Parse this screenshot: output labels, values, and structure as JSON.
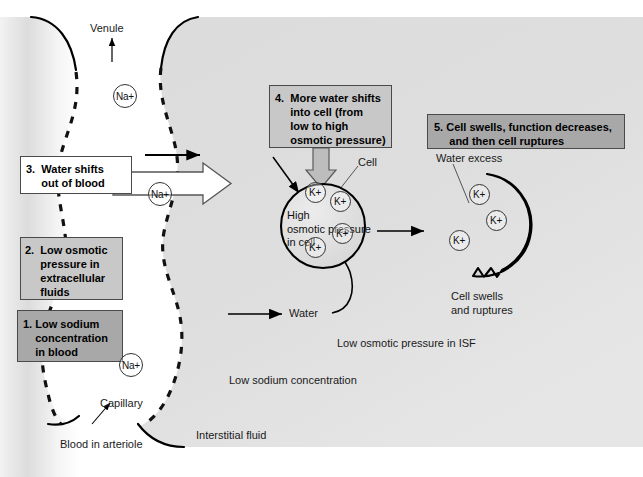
{
  "figure": {
    "colors": {
      "interstitial_fluid": "#d9d9d9",
      "blood_vessel": "#e8e8e8",
      "box_light_gray": "#c8c8c8",
      "box_dark_gray": "#a8a8a8",
      "box_white": "#ffffff",
      "outline": "#000000",
      "arrow_white_fill": "#ffffff",
      "arrow_gray_fill": "#bdbdbd",
      "text": "#1a1a1a"
    }
  },
  "steps": [
    {
      "number": "1.",
      "text": "Low sodium\nconcentration\nin blood",
      "style": "box-gray-dark"
    },
    {
      "number": "2.",
      "text": "Low osmotic\npressure in\nextracellular\nfluids",
      "style": "box-gray-light"
    },
    {
      "number": "3.",
      "text": "Water shifts\nout of blood",
      "style": "box-white"
    },
    {
      "number": "4.",
      "text": "More water shifts\ninto cell (from\nlow to high\nosmotic pressure)",
      "style": "box-gray-light"
    },
    {
      "number": "5.",
      "text": "Cell swells, function decreases,\nand then cell ruptures",
      "style": "box-gray-dark"
    }
  ],
  "box_text": {
    "step1": "1. Low sodium\n    concentration\n    in blood",
    "step2": "2.  Low osmotic\n     pressure in\n     extracellular\n     fluids",
    "step3": "3.  Water shifts\n     out of blood",
    "step4": "4.  More water shifts\n     into cell (from\n     low to high\n     osmotic pressure)",
    "step5": "5. Cell swells, function decreases,\n     and then cell ruptures"
  },
  "labels": {
    "venule": "Venule",
    "capillary": "Capillary",
    "blood_in_arteriole": "Blood in arteriole",
    "interstitial_fluid": "Interstitial fluid",
    "low_sodium_concentration": "Low sodium concentration",
    "low_osmotic_pressure_isf": "Low osmotic pressure in ISF",
    "cell": "Cell",
    "water": "Water",
    "water_excess": "Water excess",
    "cell_swells_and_ruptures": "Cell swells\nand ruptures",
    "high_osmotic_pressure_in_cell": "High\nosmotic pressure\nin cell"
  },
  "ions": {
    "sodium_label": "Na+",
    "potassium_label": "K+",
    "sodium_count": 3,
    "potassium_cell1_count": 4,
    "potassium_cell2_count": 3
  },
  "sodium_ions": [
    {
      "x": 125,
      "y": 96
    },
    {
      "x": 160,
      "y": 194
    },
    {
      "x": 131,
      "y": 365
    }
  ],
  "potassium_cell1": [
    {
      "x": 315,
      "y": 192
    },
    {
      "x": 340,
      "y": 201
    },
    {
      "x": 342,
      "y": 233
    },
    {
      "x": 315,
      "y": 247
    }
  ],
  "potassium_cell2": [
    {
      "x": 479,
      "y": 194
    },
    {
      "x": 496,
      "y": 220
    },
    {
      "x": 459,
      "y": 240
    }
  ],
  "cells": {
    "cell1": {
      "cx": 323,
      "cy": 226,
      "r": 42,
      "label": "High osmotic pressure in cell"
    },
    "cell2": {
      "cx": 487,
      "cy": 225,
      "r": 51,
      "label": "Water excess"
    }
  },
  "icon_names": {
    "arrow_right": "arrow-right-icon",
    "arrow_up": "arrow-up-icon",
    "block_arrow_right": "block-arrow-right-icon",
    "block_arrow_down": "block-arrow-down-icon",
    "curved_arrow": "curved-arrow-icon",
    "leader_line": "leader-line-icon"
  }
}
